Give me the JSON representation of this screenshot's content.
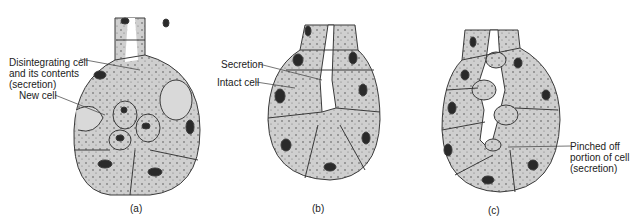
{
  "figure": {
    "panels": [
      {
        "id": "a",
        "caption": "(a)",
        "labels": [
          {
            "text_lines": [
              "Disintegrating cell",
              "and its contents",
              "(secretion)"
            ]
          },
          {
            "text_lines": [
              "New cell"
            ]
          }
        ]
      },
      {
        "id": "b",
        "caption": "(b)",
        "labels": [
          {
            "text_lines": [
              "Secretion"
            ]
          },
          {
            "text_lines": [
              "Intact cell"
            ]
          }
        ]
      },
      {
        "id": "c",
        "caption": "(c)",
        "labels": [
          {
            "text_lines": [
              "Pinched off",
              "portion of cell",
              "(secretion)"
            ]
          }
        ]
      }
    ],
    "colors": {
      "cell_fill": "#cfcfcf",
      "outline": "#3a3a3a",
      "nucleus": "#2a2a2a",
      "lumen": "#ffffff"
    }
  }
}
